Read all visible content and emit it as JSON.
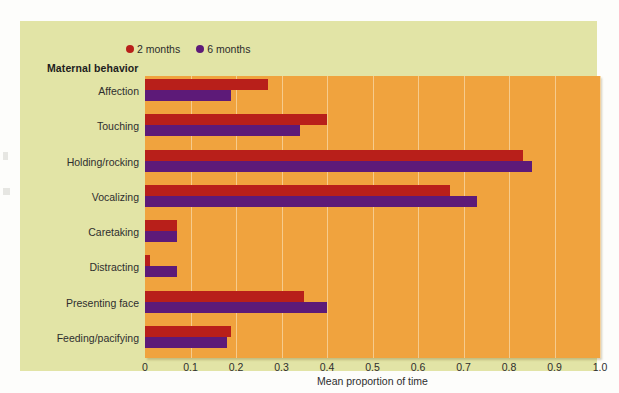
{
  "figure": {
    "group_axis_title": "Maternal behavior",
    "panel_color": "#e2e4a6",
    "plot_color": "#f0a33e",
    "gridline_color": "#f7d29a"
  },
  "legend": {
    "position": "top-left",
    "items": [
      {
        "label": "2 months",
        "color": "#b81f1a",
        "marker": "legend-dot-icon"
      },
      {
        "label": "6 months",
        "color": "#5d1a78",
        "marker": "legend-dot-icon"
      }
    ]
  },
  "chart_data": {
    "type": "bar",
    "orientation": "horizontal",
    "title": "",
    "subtitle": "",
    "xlabel": "Mean proportion of time",
    "ylabel": "Maternal behavior",
    "xlim": [
      0,
      1.0
    ],
    "xticks": [
      "0",
      "0.1",
      "0.2",
      "0.3",
      "0.4",
      "0.5",
      "0.6",
      "0.7",
      "0.8",
      "0.9",
      "1.0"
    ],
    "xtick_values": [
      0,
      0.1,
      0.2,
      0.3,
      0.4,
      0.5,
      0.6,
      0.7,
      0.8,
      0.9,
      1.0
    ],
    "grid": "vertical",
    "legend_position": "top-left",
    "categories": [
      "Affection",
      "Touching",
      "Holding/rocking",
      "Vocalizing",
      "Caretaking",
      "Distracting",
      "Presenting face",
      "Feeding/pacifying"
    ],
    "series": [
      {
        "name": "2 months",
        "color": "#b81f1a",
        "values": [
          0.27,
          0.4,
          0.83,
          0.67,
          0.07,
          0.01,
          0.35,
          0.19
        ]
      },
      {
        "name": "6 months",
        "color": "#5d1a78",
        "values": [
          0.19,
          0.34,
          0.85,
          0.73,
          0.07,
          0.07,
          0.4,
          0.18
        ]
      }
    ]
  }
}
